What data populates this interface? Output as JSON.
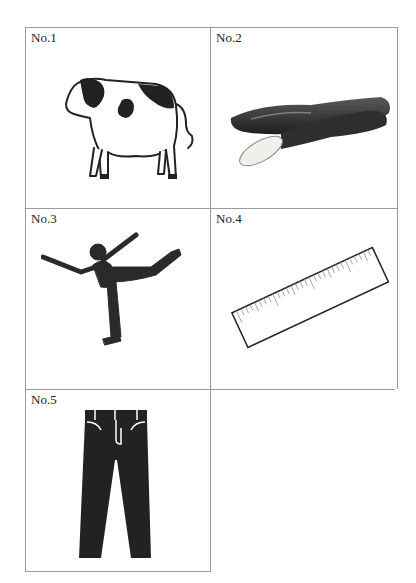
{
  "worksheet": {
    "cells": [
      {
        "label": "No.1",
        "item": "cow",
        "description": "Holstein cow line illustration"
      },
      {
        "label": "No.2",
        "item": "cucumbers",
        "description": "Photo of cucumbers, one cut"
      },
      {
        "label": "No.3",
        "item": "figure-skater",
        "description": "Silhouette of figure skater in spiral pose"
      },
      {
        "label": "No.4",
        "item": "ruler",
        "description": "Tilted ruler with tick marks"
      },
      {
        "label": "No.5",
        "item": "jeans",
        "description": "Dark jeans/trousers illustration"
      }
    ]
  },
  "colors": {
    "border": "#9a9a9a",
    "ink": "#222222",
    "silhouette": "#2a2a2a"
  }
}
